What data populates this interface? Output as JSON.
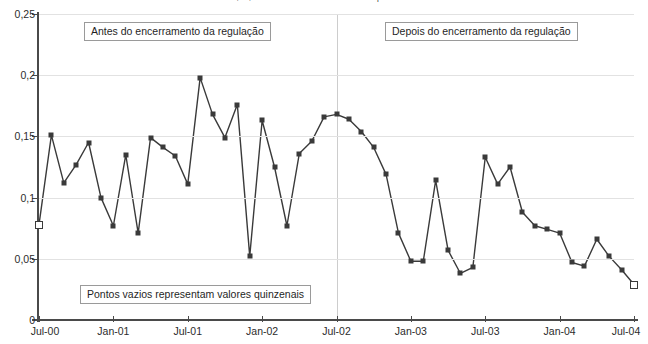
{
  "chart_title": "Diabetes, cv, Brasil: desvios-condicionalidades por local indicador",
  "annotations": {
    "before_label": "Antes do encerramento da regulação",
    "after_label": "Depois do encerramento da regulação",
    "note_label": "Pontos vazios representam valores quinzenais"
  },
  "colors": {
    "line": "#3a3a3a",
    "marker_fill": "#3a3a3a",
    "marker_hollow_fill": "#ffffff",
    "gridline": "#e2e2e2",
    "axis": "#4a4a4a",
    "divider": "#cdcdcd",
    "annotation_border": "#9a9a9a"
  },
  "chart_data": {
    "type": "line",
    "title": "Diabetes, cv, Brasil: desvios-condicionalidades por local indicador",
    "xlabel": "",
    "ylabel": "",
    "ylim": [
      0,
      0.25
    ],
    "ytick_labels": [
      "0",
      "0,05",
      "0,1",
      "0,15",
      "0,2",
      "0,25"
    ],
    "ytick_values": [
      0,
      0.05,
      0.1,
      0.15,
      0.2,
      0.25
    ],
    "xtick_labels": [
      "Jul-00",
      "Jan-01",
      "Jul-01",
      "Jan-02",
      "Jul-02",
      "Jan-03",
      "Jul-03",
      "Jan-04",
      "Jul-04"
    ],
    "xtick_values": [
      0,
      6,
      12,
      18,
      24,
      30,
      36,
      42,
      48
    ],
    "grid": "horizontal",
    "legend": "none",
    "divider_x": 24,
    "divider_note": "vertical line at Jul-02 marking end of regulation",
    "marker_style": "square",
    "hollow_marker_indices": [
      0,
      48
    ],
    "hollow_marker_meaning": "Pontos vazios representam valores quinzenais",
    "x": [
      0,
      1,
      2,
      3,
      4,
      5,
      6,
      7,
      8,
      9,
      10,
      11,
      12,
      13,
      14,
      15,
      16,
      17,
      18,
      19,
      20,
      21,
      22,
      23,
      24,
      25,
      26,
      27,
      28,
      29,
      30,
      31,
      32,
      33,
      34,
      35,
      36,
      37,
      38,
      39,
      40,
      41,
      42,
      43,
      44,
      45,
      46,
      47,
      48
    ],
    "values": [
      0.078,
      0.151,
      0.112,
      0.127,
      0.145,
      0.1,
      0.077,
      0.135,
      0.071,
      0.149,
      0.141,
      0.134,
      0.111,
      0.198,
      0.168,
      0.149,
      0.176,
      0.052,
      0.163,
      0.125,
      0.077,
      0.136,
      0.146,
      0.166,
      0.168,
      0.164,
      0.154,
      0.141,
      0.119,
      0.071,
      0.048,
      0.048,
      0.114,
      0.057,
      0.038,
      0.043,
      0.133,
      0.111,
      0.125,
      0.088,
      0.077,
      0.074,
      0.071,
      0.047,
      0.044,
      0.066,
      0.052,
      0.041,
      0.029
    ]
  }
}
